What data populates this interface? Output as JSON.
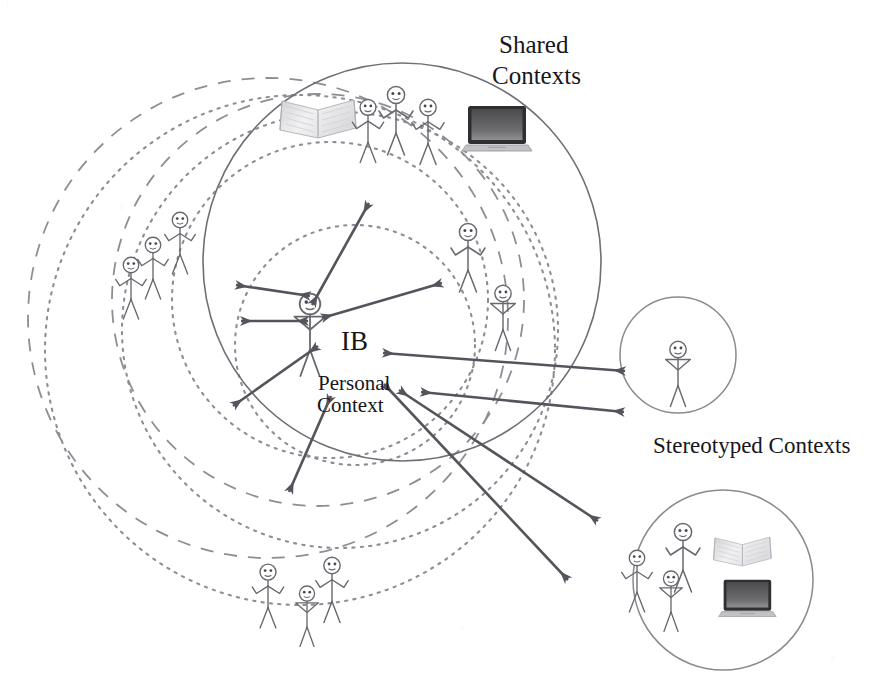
{
  "canvas": {
    "width": 874,
    "height": 700,
    "background": "#ffffff"
  },
  "labels": {
    "shared_contexts_line1": "Shared",
    "shared_contexts_line2": "Contexts",
    "stereotyped_contexts": "Stereotyped Contexts",
    "ib": "IB",
    "personal_line1": "Personal",
    "personal_line2": "Context"
  },
  "colors": {
    "background": "#ffffff",
    "solid_circle_stroke": "#6e6e75",
    "dashed_circle_stroke": "#8d8d95",
    "dotted_circle_stroke": "#8d8d95",
    "arrow_stroke": "#55535b",
    "figure_stroke": "#6a686f",
    "text": "#17161a",
    "laptop_screen": "#3a3a3c",
    "laptop_body": "#b9b9bb",
    "book_page": "#e2e2e4"
  },
  "circles": {
    "shared_contexts": {
      "cx": 402,
      "cy": 262,
      "r": 199,
      "style": "solid",
      "label": "Shared Contexts"
    },
    "stereotyped_small": {
      "cx": 678,
      "cy": 355,
      "r": 58,
      "style": "solid",
      "label": "Stereotyped Context single"
    },
    "stereotyped_large": {
      "cx": 723,
      "cy": 580,
      "r": 90,
      "style": "solid",
      "label": "Stereotyped Context group"
    },
    "personal_dashed_a": {
      "cx": 268,
      "cy": 318,
      "r": 240,
      "style": "dashed"
    },
    "personal_dashed_b": {
      "cx": 318,
      "cy": 300,
      "r": 206,
      "style": "dashed"
    },
    "personal_dotted_a": {
      "cx": 300,
      "cy": 350,
      "r": 255,
      "style": "dotted"
    },
    "personal_dotted_b": {
      "cx": 340,
      "cy": 330,
      "r": 218,
      "style": "dotted"
    },
    "personal_dotted_c": {
      "cx": 330,
      "cy": 300,
      "r": 158,
      "style": "dotted"
    },
    "personal_dotted_d": {
      "cx": 355,
      "cy": 345,
      "r": 120,
      "style": "dotted"
    }
  },
  "figures": [
    {
      "id": "central-ib",
      "x": 310,
      "y": 300,
      "scale": 1.18,
      "pose": "hands-on-hips",
      "group": "personal-context"
    },
    {
      "id": "shared-top-1",
      "x": 368,
      "y": 103,
      "scale": 0.92,
      "pose": "arms-up"
    },
    {
      "id": "shared-top-2",
      "x": 394,
      "y": 93,
      "scale": 1.0,
      "pose": "arms-up"
    },
    {
      "id": "shared-top-3",
      "x": 427,
      "y": 103,
      "scale": 0.95,
      "pose": "arms-up"
    },
    {
      "id": "shared-right-1",
      "x": 466,
      "y": 228,
      "scale": 1.0,
      "pose": "arms-up"
    },
    {
      "id": "shared-right-2",
      "x": 500,
      "y": 288,
      "scale": 0.95,
      "pose": "hands-on-hips"
    },
    {
      "id": "left-1",
      "x": 128,
      "y": 258,
      "scale": 0.9,
      "pose": "arms-up"
    },
    {
      "id": "left-2",
      "x": 149,
      "y": 240,
      "scale": 0.9,
      "pose": "arms-up"
    },
    {
      "id": "left-3",
      "x": 176,
      "y": 215,
      "scale": 0.9,
      "pose": "arms-up"
    },
    {
      "id": "bottom-1",
      "x": 266,
      "y": 568,
      "scale": 0.93,
      "pose": "arms-up"
    },
    {
      "id": "bottom-2",
      "x": 305,
      "y": 590,
      "scale": 0.88,
      "pose": "hands-on-hips"
    },
    {
      "id": "bottom-3",
      "x": 330,
      "y": 563,
      "scale": 0.95,
      "pose": "arms-up"
    },
    {
      "id": "stereo-single",
      "x": 678,
      "y": 345,
      "scale": 0.95,
      "pose": "hands-on-hips"
    },
    {
      "id": "stereo-group-1",
      "x": 635,
      "y": 553,
      "scale": 0.9,
      "pose": "arms-up"
    },
    {
      "id": "stereo-group-2",
      "x": 681,
      "y": 530,
      "scale": 1.0,
      "pose": "arms-up"
    },
    {
      "id": "stereo-group-3",
      "x": 669,
      "y": 572,
      "scale": 0.88,
      "pose": "hands-on-hips"
    }
  ],
  "objects": [
    {
      "id": "book-shared",
      "type": "book",
      "x": 278,
      "y": 94,
      "w": 80,
      "h": 58
    },
    {
      "id": "laptop-shared",
      "type": "laptop",
      "x": 466,
      "y": 104,
      "w": 62,
      "h": 48
    },
    {
      "id": "book-stereo",
      "type": "book",
      "x": 717,
      "y": 536,
      "w": 60,
      "h": 44
    },
    {
      "id": "laptop-stereo",
      "type": "laptop",
      "x": 722,
      "y": 585,
      "w": 52,
      "h": 40
    }
  ],
  "arrows": [
    {
      "id": "arrow-up-right",
      "x1": 312,
      "y1": 305,
      "x2": 367,
      "y2": 205,
      "heads": "both"
    },
    {
      "id": "arrow-left-upper",
      "x1": 312,
      "y1": 297,
      "x2": 238,
      "y2": 285,
      "heads": "both"
    },
    {
      "id": "arrow-left-lower",
      "x1": 310,
      "y1": 320,
      "x2": 243,
      "y2": 320,
      "heads": "both"
    },
    {
      "id": "arrow-upper-right-diag",
      "x1": 321,
      "y1": 316,
      "x2": 440,
      "y2": 283,
      "heads": "both"
    },
    {
      "id": "arrow-right-long",
      "x1": 381,
      "y1": 353,
      "x2": 623,
      "y2": 370,
      "heads": "both"
    },
    {
      "id": "arrow-down-left",
      "x1": 318,
      "y1": 345,
      "x2": 235,
      "y2": 405,
      "heads": "both"
    },
    {
      "id": "arrow-down",
      "x1": 330,
      "y1": 395,
      "x2": 290,
      "y2": 490,
      "heads": "both"
    },
    {
      "id": "arrow-to-stereo-small",
      "x1": 423,
      "y1": 390,
      "x2": 622,
      "y2": 410,
      "heads": "both"
    },
    {
      "id": "arrow-to-stereo-large",
      "x1": 400,
      "y1": 390,
      "x2": 596,
      "y2": 520,
      "heads": "both"
    },
    {
      "id": "arrow-far-bottom-right",
      "x1": 385,
      "y1": 385,
      "x2": 566,
      "y2": 578,
      "heads": "both"
    }
  ]
}
